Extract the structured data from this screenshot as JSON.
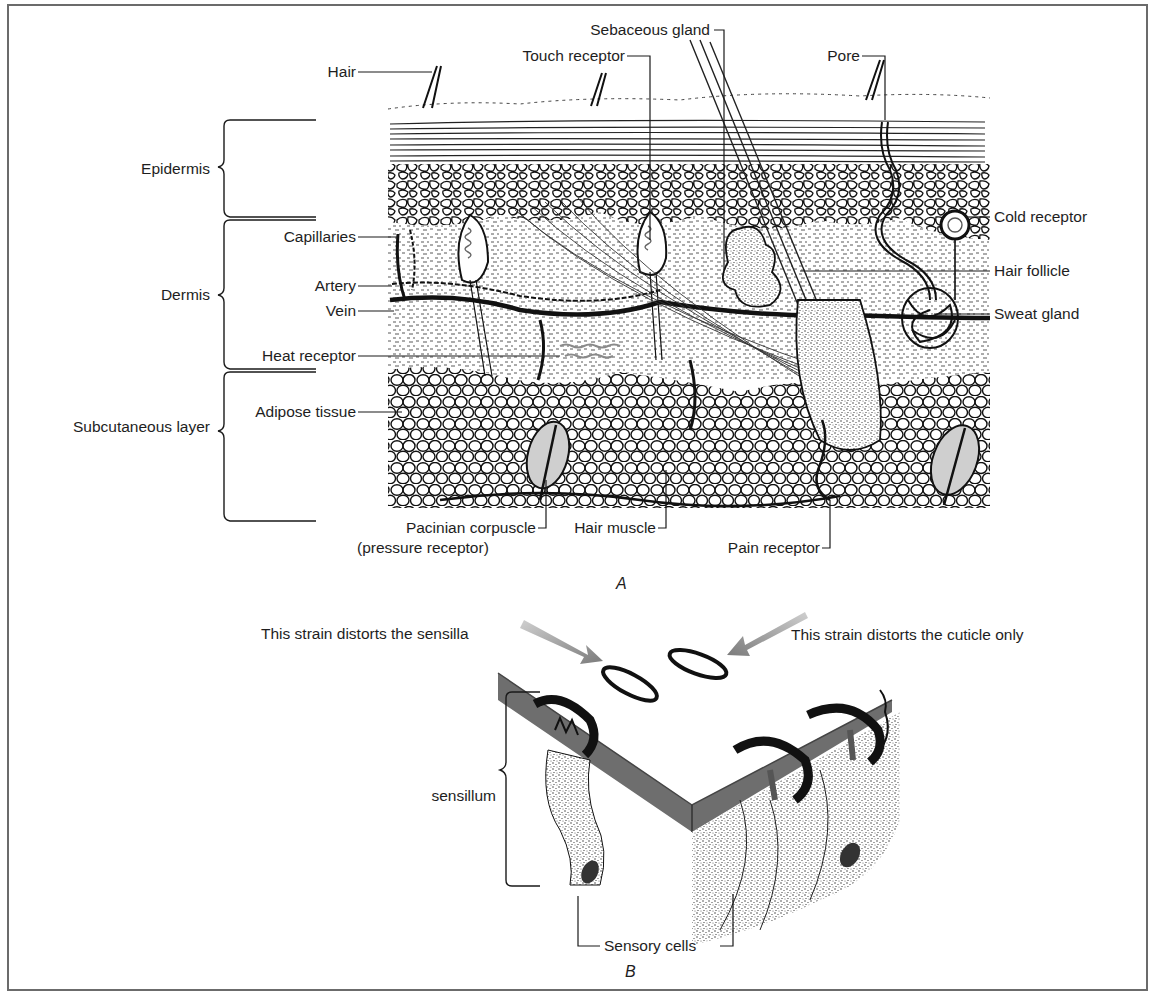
{
  "figure": {
    "panel_a": {
      "caption": "A",
      "layers": [
        {
          "name": "Epidermis"
        },
        {
          "name": "Dermis"
        },
        {
          "name": "Subcutaneous layer"
        }
      ],
      "labels_left": {
        "hair": "Hair",
        "capillaries": "Capillaries",
        "artery": "Artery",
        "vein": "Vein",
        "heat_receptor": "Heat receptor",
        "adipose_tissue": "Adipose tissue"
      },
      "labels_top": {
        "touch_receptor": "Touch receptor",
        "sebaceous_gland": "Sebaceous gland",
        "pore": "Pore"
      },
      "labels_right": {
        "cold_receptor": "Cold receptor",
        "hair_follicle": "Hair follicle",
        "sweat_gland": "Sweat gland"
      },
      "labels_bottom": {
        "pacinian_line1": "Pacinian corpuscle",
        "pacinian_line2": "(pressure receptor)",
        "hair_muscle": "Hair muscle",
        "pain_receptor": "Pain receptor"
      }
    },
    "panel_b": {
      "caption": "B",
      "strain_left": "This strain distorts the sensilla",
      "strain_right": "This strain distorts the cuticle only",
      "sensillum": "sensillum",
      "sensory_cells": "Sensory cells"
    },
    "colors": {
      "ink": "#111111",
      "frame": "#6b6b6b",
      "cuticle_gray": "#6e6e6e",
      "arrow_gray": "#8a8a8a"
    }
  }
}
